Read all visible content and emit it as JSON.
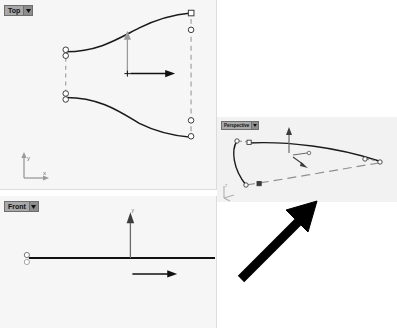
{
  "app": {
    "kind": "cad-3d-modeler",
    "background_color": "#ffffff"
  },
  "viewports": [
    {
      "id": "top",
      "title": "Top",
      "caret_icon": "chevron-down-icon",
      "background_color": "#f6f6f7",
      "axis_widget": {
        "name": "axis-indicator",
        "labels": [
          "y",
          "x"
        ]
      }
    },
    {
      "id": "front",
      "title": "Front",
      "caret_icon": "chevron-down-icon",
      "background_color": "#f6f6f7",
      "gumball": {
        "name": "gumball-widget",
        "axis_labels": [
          "y",
          "x"
        ]
      }
    },
    {
      "id": "perspective",
      "title": "Perspective",
      "caret_icon": "chevron-down-icon",
      "background_color": "#f2f2f3",
      "axis_widget": {
        "name": "axis-indicator",
        "labels": [
          "z",
          "y",
          "x"
        ]
      }
    }
  ],
  "top_view": {
    "gumball": {
      "name": "gumball-widget",
      "origin_marker": "plus-marker",
      "y_axis_color": "#8d8d8d",
      "x_axis_color": "#1a1a1a"
    },
    "curve_color": "#1a1a1a",
    "control_point_color": "#ffffff",
    "control_polygon_color": "#8d8d8d"
  },
  "front_view": {
    "curve_color": "#1a1a1a",
    "gumball": {
      "name": "gumball-widget",
      "y_axis_color": "#555555",
      "x_axis_color": "#1a1a1a"
    }
  },
  "perspective_view": {
    "curve_color": "#1a1a1a",
    "control_polygon_color": "#b8b8b8",
    "gumball": {
      "name": "gumball-widget"
    }
  },
  "annotation": {
    "name": "pointer-arrow-annotation",
    "color": "#000000",
    "direction": "up-right"
  }
}
